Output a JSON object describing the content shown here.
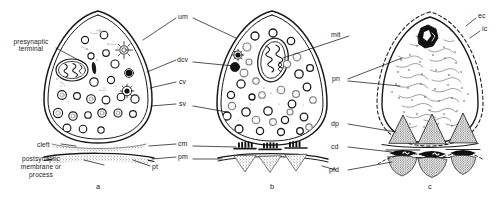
{
  "figure": {
    "background_color": "#ffffff",
    "ink_color": "#1a1a1a",
    "fill_gray": "#9a9a9a",
    "width": 501,
    "height": 202
  },
  "panels": [
    {
      "id": "a",
      "letter": "a",
      "caption": "a",
      "description": "Presynaptic terminal with clear synaptic vesicles, dense core vesicle, coated vesicle and synaptic cleft",
      "outline": "double-line closed teardrop",
      "labels": [
        {
          "key": "presynaptic_terminal",
          "text": "presynaptic\nterminal",
          "line1": "presynaptic",
          "line2": "terminal"
        },
        {
          "key": "cleft",
          "text": "cleft"
        },
        {
          "key": "postsynaptic",
          "line1": "postsynaptic",
          "line2": "membrane  or",
          "line3": "process"
        },
        {
          "key": "pt",
          "text": "pt"
        }
      ]
    },
    {
      "id": "b",
      "letter": "b",
      "caption": "b",
      "description": "Terminal with large mitochondrion, mixed vesicle population and three active zones with dense projections",
      "outline": "double-line closed teardrop",
      "labels": [
        {
          "key": "mit",
          "text": "mit"
        }
      ]
    },
    {
      "id": "c",
      "letter": "c",
      "caption": "c",
      "description": "Terminal with extracellular coat, presynaptic network, dense projections, cleft density and postsynaptic fibrous density",
      "outline": "dashed outer coat with solid inner membrane",
      "labels": [
        {
          "key": "ec",
          "text": "ec"
        },
        {
          "key": "ic",
          "text": "ic"
        },
        {
          "key": "mit",
          "text": "mit"
        },
        {
          "key": "pn",
          "text": "pn"
        },
        {
          "key": "dp",
          "text": "dp"
        },
        {
          "key": "cd",
          "text": "cd"
        },
        {
          "key": "pfd",
          "text": "pfd"
        }
      ]
    }
  ],
  "center_labels": [
    {
      "key": "um",
      "text": "um",
      "meaning": "unit membrane"
    },
    {
      "key": "dcv",
      "text": "dcv",
      "meaning": "dense core vesicle"
    },
    {
      "key": "cv",
      "text": "cv",
      "meaning": "coated vesicle"
    },
    {
      "key": "sv",
      "text": "sv",
      "meaning": "synaptic vesicle"
    },
    {
      "key": "cm",
      "text": "cm",
      "meaning": "cleft material"
    },
    {
      "key": "pm",
      "text": "pm",
      "meaning": "postsynaptic membrane"
    }
  ],
  "labels_flat": {
    "presynaptic_terminal_line1": "presynaptic",
    "presynaptic_terminal_line2": "terminal",
    "cleft": "cleft",
    "postsynaptic_line1": "postsynaptic",
    "postsynaptic_line2": "membrane  or",
    "postsynaptic_line3": "process",
    "pt": "pt",
    "um": "um",
    "dcv": "dcv",
    "cv": "cv",
    "sv": "sv",
    "cm": "cm",
    "pm": "pm",
    "mit_b": "mit",
    "ec": "ec",
    "ic": "ic",
    "pn": "pn",
    "dp": "dp",
    "cd": "cd",
    "pfd": "pfd",
    "panel_a": "a",
    "panel_b": "b",
    "panel_c": "c"
  }
}
